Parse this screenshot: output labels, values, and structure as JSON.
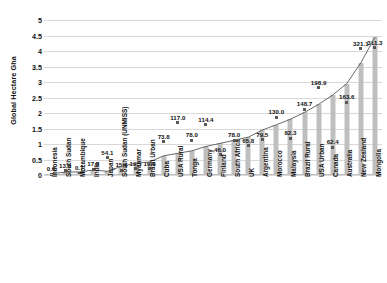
{
  "chart_data": {
    "type": "bar",
    "title": "",
    "xlabel": "",
    "ylabel": "Global Hectare Gha",
    "ylim": [
      0,
      5
    ],
    "yticks": [
      "0",
      "0.5",
      "1",
      "1.5",
      "2",
      "2.5",
      "3",
      "3.5",
      "4",
      "4.5",
      "5"
    ],
    "grid": true,
    "legend": "none",
    "categories": [
      "Indonesia",
      "South Sudan",
      "Mozambique",
      "India",
      "Japan",
      "South Sudan (UNMISS)",
      "Myanmar",
      "Brazil Urban",
      "Cuba",
      "USA Rural",
      "Tonga",
      "Germany",
      "Finland",
      "South Africa",
      "UK",
      "Argentina",
      "Morocco",
      "Malaysia",
      "Brazil Rural",
      "USA Urban",
      "Canada",
      "Australia",
      "New Zealand",
      "Mongolia"
    ],
    "series": [
      {
        "name": "Global Hectare Gha",
        "type": "bar",
        "values": [
          0.04,
          0.09,
          0.1,
          0.16,
          0.12,
          0.28,
          0.38,
          0.42,
          0.62,
          0.7,
          0.78,
          0.92,
          1.02,
          1.12,
          1.22,
          1.45,
          1.62,
          1.8,
          2.02,
          2.28,
          2.58,
          2.95,
          3.62,
          4.45
        ]
      },
      {
        "name": "Data labels",
        "type": "scatter",
        "labels": [
          "0.0",
          "13.0",
          "0.7",
          "17.3",
          "54.1",
          "15.6",
          "19.5",
          "19.6",
          "73.8",
          "117.0",
          "78.0",
          "114.4",
          "46.0",
          "78.0",
          "65.8",
          "79.5",
          "130.0",
          "82.3",
          "148.7",
          "198.9",
          "62.4",
          "163.6",
          "321.1",
          "311.3"
        ],
        "values": [
          0.03,
          0.13,
          0.06,
          0.18,
          0.55,
          0.16,
          0.2,
          0.2,
          1.08,
          1.68,
          1.12,
          1.62,
          0.66,
          1.12,
          0.94,
          1.14,
          1.86,
          1.18,
          2.12,
          2.82,
          0.9,
          2.34,
          4.08,
          4.1
        ]
      }
    ]
  }
}
